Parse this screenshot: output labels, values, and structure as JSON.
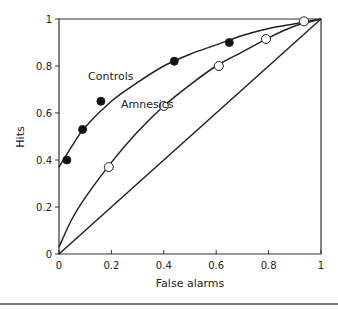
{
  "chart_data": {
    "type": "scatter",
    "title": "",
    "xlabel": "False alarms",
    "ylabel": "Hits",
    "xlim": [
      0,
      1
    ],
    "ylim": [
      0,
      1
    ],
    "x_ticks": [
      "0",
      "0.2",
      "0.4",
      "0.6",
      "0.8",
      "1"
    ],
    "y_ticks": [
      "0",
      "0.2",
      "0.4",
      "0.6",
      "0.8",
      "1"
    ],
    "grid": false,
    "legend": "inline labels",
    "series": [
      {
        "name": "Controls",
        "marker": "filled-circle",
        "points": [
          {
            "x": 0.03,
            "y": 0.4
          },
          {
            "x": 0.09,
            "y": 0.53
          },
          {
            "x": 0.16,
            "y": 0.65
          },
          {
            "x": 0.44,
            "y": 0.82
          },
          {
            "x": 0.65,
            "y": 0.9
          }
        ],
        "fit_curve": [
          [
            0,
            0.37
          ],
          [
            0.05,
            0.46
          ],
          [
            0.1,
            0.54
          ],
          [
            0.2,
            0.65
          ],
          [
            0.3,
            0.73
          ],
          [
            0.4,
            0.8
          ],
          [
            0.5,
            0.85
          ],
          [
            0.6,
            0.89
          ],
          [
            0.7,
            0.93
          ],
          [
            0.8,
            0.96
          ],
          [
            0.9,
            0.98
          ],
          [
            1,
            1
          ]
        ]
      },
      {
        "name": "Amnesics",
        "marker": "open-circle",
        "points": [
          {
            "x": 0.19,
            "y": 0.37
          },
          {
            "x": 0.4,
            "y": 0.63
          },
          {
            "x": 0.61,
            "y": 0.8
          },
          {
            "x": 0.79,
            "y": 0.915
          },
          {
            "x": 0.935,
            "y": 0.99
          }
        ],
        "fit_curve": [
          [
            0,
            0.03
          ],
          [
            0.05,
            0.15
          ],
          [
            0.1,
            0.24
          ],
          [
            0.2,
            0.39
          ],
          [
            0.3,
            0.52
          ],
          [
            0.4,
            0.63
          ],
          [
            0.5,
            0.72
          ],
          [
            0.6,
            0.8
          ],
          [
            0.7,
            0.86
          ],
          [
            0.8,
            0.92
          ],
          [
            0.9,
            0.97
          ],
          [
            1,
            1
          ]
        ]
      },
      {
        "name": "Chance",
        "marker": "none",
        "fit_curve": [
          [
            0,
            0
          ],
          [
            1,
            1
          ]
        ]
      }
    ],
    "annotations": [
      {
        "text": "Controls",
        "x": 0.11,
        "y": 0.74
      },
      {
        "text": "Amnesics",
        "x": 0.23,
        "y": 0.55
      }
    ]
  },
  "labels": {
    "xlabel": "False alarms",
    "ylabel": "Hits",
    "controls": "Controls",
    "amnesics": "Amnesics"
  }
}
